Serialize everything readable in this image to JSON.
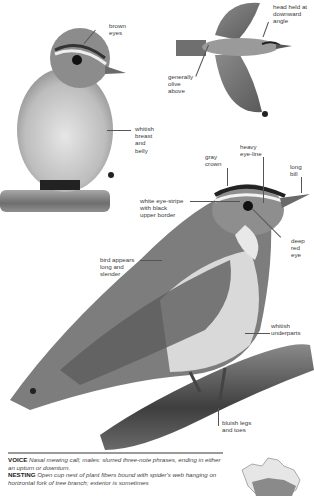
{
  "illustrations": {
    "perched_front": {
      "labels": {
        "eyes": "brown\neyes",
        "breast": "whitish\nbreast\nand\nbelly"
      }
    },
    "flight": {
      "labels": {
        "head": "head held at\ndownward\nangle",
        "upperparts": "generally\nolive\nabove"
      }
    },
    "perched_side": {
      "labels": {
        "crown": "gray\ncrown",
        "eyeline": "heavy\neye-line",
        "bill": "long\nbill",
        "eyestripe": "white eye-stripe\nwith black\nupper border",
        "eye": "deep\nred\neye",
        "shape": "bird appears\nlong and\nslender",
        "underparts": "whitish\nunderparts",
        "legs": "bluish legs\nand toes"
      }
    }
  },
  "info": {
    "voice_heading": "VOICE",
    "voice_text": "Nasal mewing call; males: slurred three-note phrases, ending in either an upturn or downturn.",
    "nesting_heading": "NESTING",
    "nesting_text": "Open cup nest of plant fibers bound with spider's web hanging on horizontal fork of tree branch; exterior is sometimes"
  },
  "colors": {
    "background": "#ffffff",
    "rule": "#9a9a9a",
    "label_text": "#3a3a3a",
    "bird_olive_gray": "#7a7a7a",
    "bird_underparts": "#d8d8d8",
    "branch": "#4a4a4a"
  }
}
